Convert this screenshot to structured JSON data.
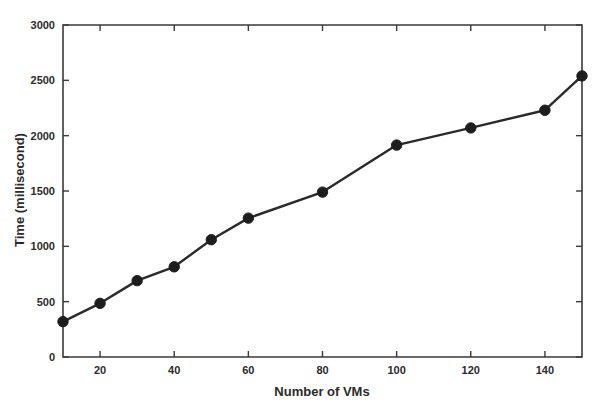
{
  "chart_data": {
    "type": "line",
    "title": "",
    "subtitle": "",
    "xlabel": "Number of VMs",
    "ylabel": "Time (millisecond)",
    "xlim": [
      10,
      150
    ],
    "ylim": [
      0,
      3000
    ],
    "grid": false,
    "legend": null,
    "x": [
      10,
      20,
      30,
      40,
      50,
      60,
      80,
      100,
      120,
      140,
      150
    ],
    "values": [
      320,
      485,
      690,
      815,
      1060,
      1255,
      1490,
      1915,
      2070,
      2230,
      2540
    ],
    "series": [
      {
        "name": "Time (millisecond)",
        "x": [
          10,
          20,
          30,
          40,
          50,
          60,
          80,
          100,
          120,
          140,
          150
        ],
        "values": [
          320,
          485,
          690,
          815,
          1060,
          1255,
          1490,
          1915,
          2070,
          2230,
          2540
        ],
        "color": "#1d1d1d",
        "marker": "circle"
      }
    ],
    "xticks": [
      20,
      40,
      60,
      80,
      100,
      120,
      140
    ],
    "xtick_labels": [
      "20",
      "40",
      "60",
      "80",
      "100",
      "120",
      "140"
    ],
    "yticks": [
      0,
      500,
      1000,
      1500,
      2000,
      2500,
      3000
    ],
    "ytick_labels": [
      "0",
      "500",
      "1000",
      "1500",
      "2000",
      "2500",
      "3000"
    ],
    "annotations": []
  },
  "axes": {
    "x_axis_title": "Number of VMs",
    "y_axis_title": "Time (millisecond)"
  },
  "colors": {
    "line": "#2a2a2a",
    "marker": "#1d1d1d",
    "axis": "#3a3a3a",
    "text": "#2b2b2b",
    "background": "#ffffff"
  }
}
